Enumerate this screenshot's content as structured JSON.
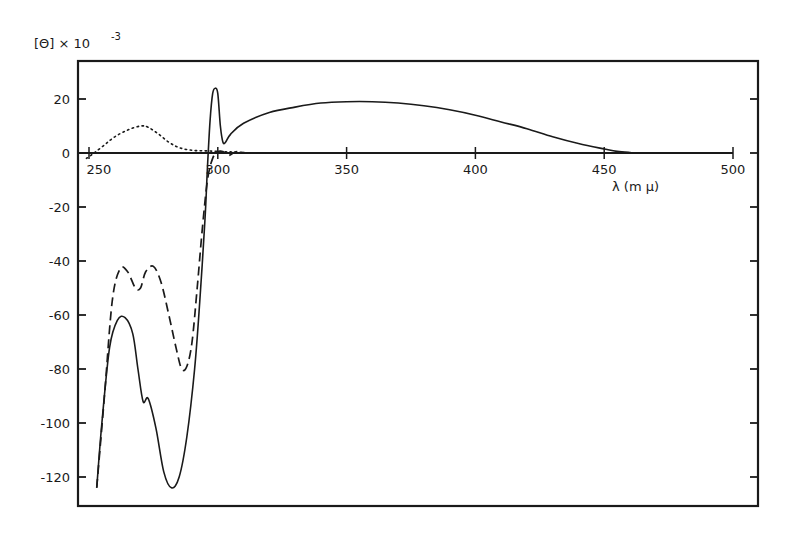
{
  "chart_data": {
    "type": "line",
    "title": "",
    "ylabel": "[Θ] × 10",
    "ylabel_exponent": "-3",
    "xlabel": "λ (m μ)",
    "xlim": [
      250,
      500
    ],
    "ylim": [
      -130,
      34
    ],
    "grid": false,
    "legend": null,
    "x_ticks": [
      250,
      300,
      350,
      400,
      450,
      500
    ],
    "x_tick_labels": [
      "250",
      "300",
      "350",
      "400",
      "450",
      "500"
    ],
    "y_ticks": [
      20,
      0,
      -20,
      -40,
      -60,
      -80,
      -100,
      -120
    ],
    "y_tick_labels": [
      "20",
      "0",
      "-20",
      "-40",
      "-60",
      "-80",
      "-100",
      "-120"
    ],
    "series": [
      {
        "name": "solid",
        "style": "solid",
        "x": [
          253,
          255,
          258,
          261,
          264,
          267,
          269,
          271,
          273,
          276,
          279,
          282,
          285,
          288,
          291,
          293,
          295,
          296,
          297,
          298,
          299,
          300,
          301,
          302,
          303,
          305,
          310,
          320,
          330,
          340,
          350,
          360,
          370,
          380,
          390,
          400,
          410,
          420,
          430,
          440,
          450,
          455,
          460,
          465,
          500
        ],
        "values": [
          -124,
          -100,
          -72,
          -62,
          -61,
          -67,
          -80,
          -92,
          -91,
          -102,
          -118,
          -124,
          -120,
          -105,
          -80,
          -55,
          -25,
          -5,
          12,
          22,
          24,
          22,
          10,
          4,
          4,
          7,
          11,
          15,
          17,
          18.5,
          19,
          19,
          18.5,
          17.5,
          16,
          14,
          11.5,
          9,
          6,
          3.5,
          1.5,
          0.6,
          0.2,
          0,
          0
        ]
      },
      {
        "name": "dashed",
        "style": "dashed",
        "x": [
          253,
          256,
          259,
          262,
          265,
          268,
          270,
          272,
          275,
          278,
          281,
          284,
          286,
          288,
          290,
          292,
          294,
          296,
          298,
          300,
          302,
          304,
          306,
          308,
          312,
          325
        ],
        "values": [
          -124,
          -90,
          -55,
          -43,
          -44,
          -50,
          -50,
          -44,
          -42,
          -48,
          -60,
          -73,
          -80,
          -79,
          -70,
          -50,
          -28,
          -10,
          -2,
          0.5,
          0.5,
          -1,
          0,
          0.5,
          0,
          0
        ]
      },
      {
        "name": "dotted",
        "style": "dotted",
        "x": [
          249,
          252,
          256,
          260,
          265,
          270,
          273,
          277,
          281,
          285,
          290,
          295,
          300,
          305,
          310
        ],
        "values": [
          -2,
          0,
          3,
          6,
          8.5,
          10,
          9.5,
          7,
          4,
          2,
          1,
          0.8,
          0.6,
          0.4,
          0.2
        ]
      }
    ]
  }
}
